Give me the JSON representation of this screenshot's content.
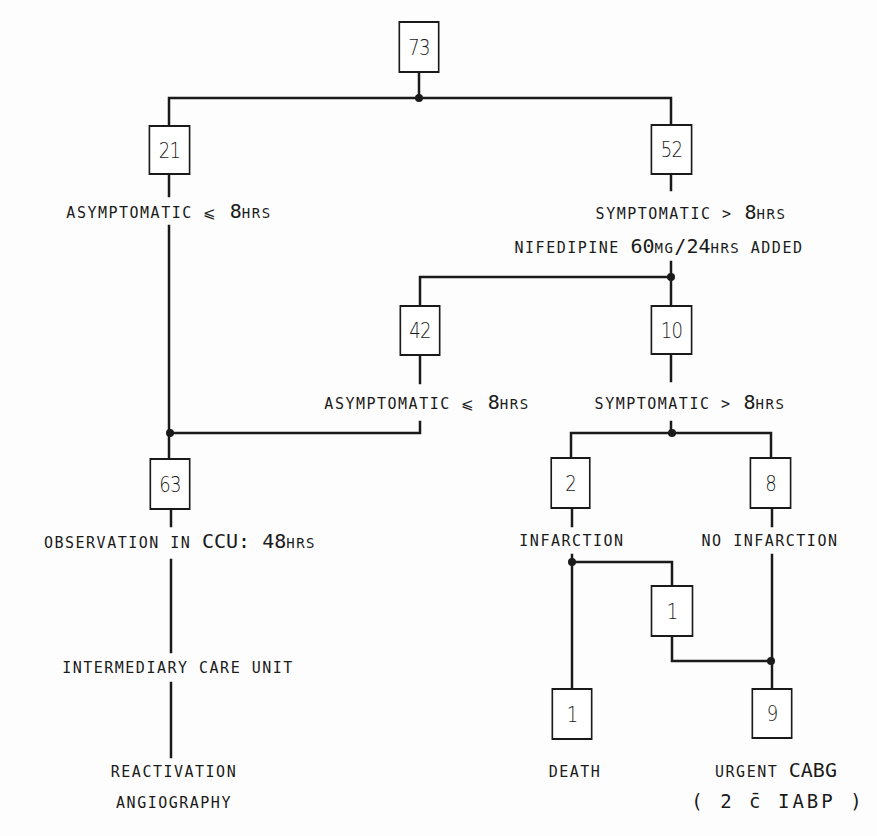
{
  "diagram": {
    "type": "flowchart",
    "colors": {
      "ink": "#1a1a1a",
      "background": "#fdfdfd"
    },
    "nodes": {
      "root": {
        "count": "73"
      },
      "asym_first": {
        "count": "21"
      },
      "sym_first": {
        "count": "52"
      },
      "asym_second": {
        "count": "42"
      },
      "sym_second": {
        "count": "10"
      },
      "observation": {
        "count": "63"
      },
      "infarction": {
        "count": "2"
      },
      "no_infarction": {
        "count": "8"
      },
      "infarction_to_cabg": {
        "count": "1"
      },
      "death": {
        "count": "1"
      },
      "urgent_cabg": {
        "count": "9"
      }
    },
    "labels": {
      "asym_first": {
        "prefix": "ASYMPTOMATIC ",
        "symbol": "⩽",
        "value": " 8",
        "unit": "HRS"
      },
      "sym_first": {
        "prefix": "SYMPTOMATIC ",
        "symbol": ">",
        "value": " 8",
        "unit": "HRS"
      },
      "nifedipine": {
        "prefix": "NIFEDIPINE ",
        "dose": "60",
        "dose_unit": "MG",
        "per": "/24",
        "per_unit": "HRS",
        "suffix": " ADDED"
      },
      "asym_second": {
        "prefix": "ASYMPTOMATIC ",
        "symbol": "⩽",
        "value": " 8",
        "unit": "HRS"
      },
      "sym_second": {
        "prefix": "SYMPTOMATIC ",
        "symbol": ">",
        "value": " 8",
        "unit": "HRS"
      },
      "observation": {
        "prefix": "OBSERVATION IN ",
        "ccu": "CCU: 48",
        "unit": "HRS"
      },
      "infarction": "INFARCTION",
      "no_infarction": "NO INFARCTION",
      "intermediary": "INTERMEDIARY CARE UNIT",
      "reactivation": "REACTIVATION",
      "angiography": "ANGIOGRAPHY",
      "death": "DEATH",
      "urgent_cabg": {
        "prefix": "URGENT ",
        "procedure": "CABG"
      },
      "iabp": "( 2 c̄ IABP )"
    }
  }
}
